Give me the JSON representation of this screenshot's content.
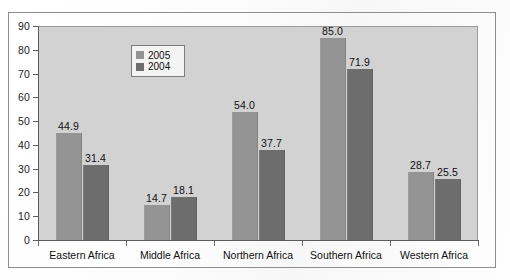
{
  "chart_data": {
    "type": "bar",
    "title": "",
    "xlabel": "",
    "ylabel": "",
    "ylim": [
      0,
      90
    ],
    "ytick_step": 10,
    "yticks": [
      "90",
      "80",
      "70",
      "60",
      "50",
      "40",
      "30",
      "20",
      "10",
      "0"
    ],
    "grid": false,
    "legend_position": "top-center-left",
    "categories": [
      "Eastern Africa",
      "Middle Africa",
      "Northern Africa",
      "Southern Africa",
      "Western Africa"
    ],
    "series": [
      {
        "name": "2005",
        "color": "#949494",
        "values": [
          44.9,
          14.7,
          54.0,
          85.0,
          28.7
        ],
        "labels": [
          "44.9",
          "14.7",
          "54.0",
          "85.0",
          "28.7"
        ]
      },
      {
        "name": "2004",
        "color": "#6d6d6d",
        "values": [
          31.4,
          18.1,
          37.7,
          71.9,
          25.5
        ],
        "labels": [
          "31.4",
          "18.1",
          "37.7",
          "71.9",
          "25.5"
        ]
      }
    ]
  },
  "legend": {
    "items": [
      {
        "label": "2005",
        "color": "#949494"
      },
      {
        "label": "2004",
        "color": "#6d6d6d"
      }
    ]
  },
  "style": {
    "plot_background": "#d2d2d2",
    "page_background": "#ffffff",
    "frame_border": "#8d8d8d",
    "axis_color": "#5c5c5c",
    "text_color": "#101010"
  }
}
